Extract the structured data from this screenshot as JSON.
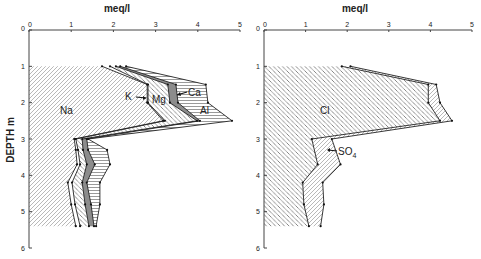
{
  "chart_data": [
    {
      "type": "area",
      "subtype": "stacked-depth-profile",
      "title": "",
      "xlabel": "meq/l",
      "ylabel": "DEPTH m",
      "xlim": [
        0,
        5
      ],
      "ylim": [
        6,
        0
      ],
      "x_ticks": [
        "0",
        "1",
        "2",
        "3",
        "4",
        "5"
      ],
      "y_ticks": [
        "0",
        "1",
        "2",
        "3",
        "4",
        "5",
        "6"
      ],
      "grid": false,
      "legend": "inline labels",
      "depth": [
        1.0,
        1.5,
        2.0,
        2.5,
        3.0,
        3.3,
        3.7,
        4.2,
        4.8,
        5.4
      ],
      "cumulative": true,
      "series": [
        {
          "name": "Na",
          "pattern": "diag-up",
          "values": [
            1.73,
            2.8,
            2.8,
            3.18,
            1.07,
            1.11,
            1.14,
            0.92,
            1.0,
            1.11
          ]
        },
        {
          "name": "K",
          "pattern": "none",
          "values": [
            1.92,
            2.82,
            2.82,
            3.22,
            1.11,
            1.16,
            1.21,
            1.02,
            1.09,
            1.21
          ]
        },
        {
          "name": "Mg",
          "pattern": "diag-down",
          "values": [
            2.06,
            3.29,
            3.34,
            3.98,
            1.26,
            1.28,
            1.37,
            1.26,
            1.33,
            1.42
          ]
        },
        {
          "name": "Ca",
          "pattern": "solid-gray",
          "values": [
            2.16,
            3.48,
            3.53,
            4.05,
            1.37,
            1.4,
            1.56,
            1.37,
            1.47,
            1.54
          ]
        },
        {
          "name": "Al",
          "pattern": "horizontal",
          "values": [
            2.3,
            4.19,
            4.24,
            4.81,
            1.4,
            1.85,
            1.92,
            1.68,
            1.68,
            1.59
          ]
        }
      ],
      "annotations": [
        "Na",
        "K",
        "Mg",
        "Ca",
        "Al"
      ]
    },
    {
      "type": "area",
      "subtype": "stacked-depth-profile",
      "title": "",
      "xlabel": "meq/l",
      "ylabel": "",
      "xlim": [
        0,
        5
      ],
      "ylim": [
        6,
        0
      ],
      "x_ticks": [
        "0",
        "1",
        "2",
        "3",
        "4",
        "5"
      ],
      "y_ticks": [
        "0",
        "1",
        "2",
        "3",
        "4",
        "5",
        "6"
      ],
      "grid": false,
      "legend": "inline labels",
      "depth": [
        1.0,
        1.5,
        2.0,
        2.5,
        3.0,
        3.7,
        4.2,
        4.8,
        5.4
      ],
      "cumulative": true,
      "series": [
        {
          "name": "Cl",
          "pattern": "diag-down",
          "values": [
            1.87,
            3.95,
            3.95,
            4.23,
            1.15,
            1.29,
            0.93,
            0.96,
            1.08
          ]
        },
        {
          "name": "SO4",
          "pattern": "diag-up",
          "values": [
            2.08,
            4.14,
            4.23,
            4.52,
            1.63,
            1.84,
            1.41,
            1.44,
            1.36
          ]
        }
      ],
      "annotations": [
        "Cl",
        "SO4"
      ]
    }
  ],
  "labels": {
    "left_xlabel": "meq/l",
    "right_xlabel": "meq/l",
    "ylabel": "DEPTH  m",
    "na": "Na",
    "k": "K",
    "mg": "Mg",
    "ca": "Ca",
    "al": "Al",
    "cl": "Cl",
    "so4_main": "SO",
    "so4_sub": "4"
  }
}
